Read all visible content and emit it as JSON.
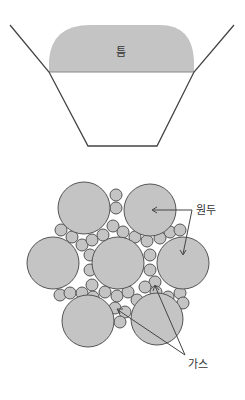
{
  "top_diagram": {
    "cap_label": "틈",
    "cap_color": "#c4c4c4",
    "line_color": "#444444"
  },
  "bottom_diagram": {
    "large_label": "원두",
    "small_label": "가스",
    "circle_fill": "#c4c4c4",
    "circle_stroke": "#555555"
  }
}
